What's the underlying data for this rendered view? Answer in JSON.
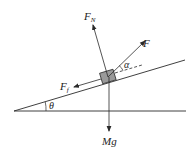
{
  "diagram": {
    "colors": {
      "line": "#2a2a2a",
      "block_fill": "#9a9a9a",
      "block_stroke": "#333333",
      "background": "#ffffff"
    },
    "labels": {
      "normal_force": "F",
      "normal_force_sub": "N",
      "applied_force": "F",
      "friction_force": "F",
      "friction_force_sub": "f",
      "weight": "Mg",
      "incline_angle": "θ",
      "force_angle": "α"
    }
  }
}
